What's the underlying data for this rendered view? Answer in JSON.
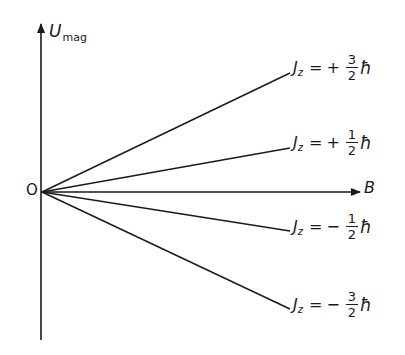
{
  "diagram": {
    "axes": {
      "y_label_main": "U",
      "y_label_sub": "mag",
      "x_label": "B",
      "origin_label": "O"
    },
    "levels": [
      {
        "label_j": "J",
        "label_sub": "z",
        "equals": "=",
        "sign": "+",
        "num": "3",
        "den": "2",
        "unit": "ħ",
        "slope_sign": "positive"
      },
      {
        "label_j": "J",
        "label_sub": "z",
        "equals": "=",
        "sign": "+",
        "num": "1",
        "den": "2",
        "unit": "ħ",
        "slope_sign": "positive"
      },
      {
        "label_j": "J",
        "label_sub": "z",
        "equals": "=",
        "sign": "−",
        "num": "1",
        "den": "2",
        "unit": "ħ",
        "slope_sign": "negative"
      },
      {
        "label_j": "J",
        "label_sub": "z",
        "equals": "=",
        "sign": "−",
        "num": "3",
        "den": "2",
        "unit": "ħ",
        "slope_sign": "negative"
      }
    ],
    "colors": {
      "line": "#1a1a1a",
      "background": "#ffffff"
    }
  }
}
